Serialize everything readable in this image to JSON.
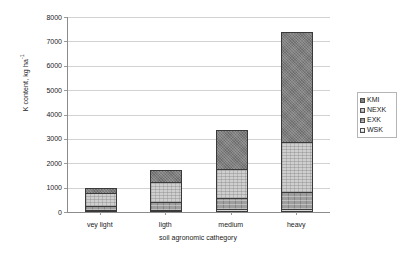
{
  "chart_data": {
    "type": "bar",
    "subtype": "stacked-column",
    "title": "",
    "xlabel": "soil agronomic cathegory",
    "ylabel": "K content, kg ha-1",
    "ylabel_base": "K content, kg ha",
    "ylabel_exponent": "-1",
    "categories": [
      "vey light",
      "ligth",
      "medium",
      "heavy"
    ],
    "series": [
      {
        "name": "WSK",
        "values": [
          70,
          80,
          120,
          130
        ]
      },
      {
        "name": "EXK",
        "values": [
          160,
          330,
          450,
          690
        ]
      },
      {
        "name": "NEXK",
        "values": [
          570,
          820,
          1180,
          2050
        ]
      },
      {
        "name": "KMI",
        "values": [
          200,
          490,
          1600,
          4530
        ]
      }
    ],
    "stack_order_bottom_to_top": [
      "WSK",
      "EXK",
      "NEXK",
      "KMI"
    ],
    "totals": [
      1000,
      1720,
      3350,
      7400
    ],
    "ylim": [
      0,
      8000
    ],
    "yticks": [
      0,
      1000,
      2000,
      3000,
      4000,
      5000,
      6000,
      7000,
      8000
    ],
    "ytick_labels": [
      "0",
      "1000",
      "2000",
      "3000",
      "4000",
      "5000",
      "6000",
      "7000",
      "8000"
    ],
    "grid": true,
    "grid_axis": "y",
    "legend_position": "right",
    "legend_entries": [
      "KMI",
      "NEXK",
      "EXK",
      "WSK"
    ],
    "colors": {
      "KMI": "#7d7d7d",
      "NEXK": "#cfcfcf",
      "EXK": "#9e9e9e",
      "WSK": "#f2f2f2",
      "gridline": "#d2d2d2",
      "axis": "#8c8c8c",
      "bar_outline": "#3a3a3a",
      "text": "#1a1a1a",
      "background": "#ffffff"
    }
  }
}
